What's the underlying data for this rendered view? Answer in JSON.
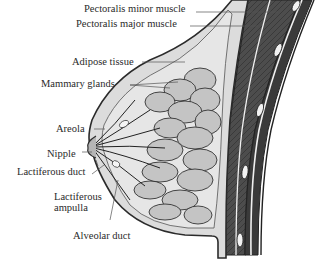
{
  "diagram": {
    "labels": {
      "pectoralis_minor": "Pectoralis minor muscle",
      "pectoralis_major": "Pectoralis major muscle",
      "adipose": "Adipose tissue",
      "mammary": "Mammary glands",
      "areola": "Areola",
      "nipple": "Nipple",
      "lactiferous_duct": "Lactiferous duct",
      "lactiferous_ampulla_1": "Lactiferous",
      "lactiferous_ampulla_2": "ampulla",
      "alveolar_duct": "Alveolar duct"
    },
    "colors": {
      "outline": "#2b2b2b",
      "muscle": "#4a4a4a",
      "fat": "#d9d9d9",
      "gland": "#bdbdbd",
      "text": "#2a2a2a"
    }
  }
}
